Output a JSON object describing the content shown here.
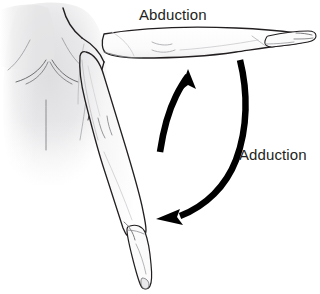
{
  "figure": {
    "title_visible": false,
    "background_color": "#ffffff",
    "view": "posterior"
  },
  "labels": {
    "abduction": "Abduction",
    "adduction": "Adduction"
  },
  "colors": {
    "outline": "#231f20",
    "arrow": "#000000",
    "text": "#231f20",
    "skin_fill": "#ffffff",
    "torso_shade": "#e2e2e4",
    "torso_shade_light": "#f0f0f2",
    "detail_line": "#6d6e71",
    "background": "#ffffff"
  },
  "arrows": [
    {
      "name": "abduction-arrow",
      "label": "Abduction",
      "direction": "upward",
      "meaning": "movement of arm away from midline of body",
      "tip_x": 188,
      "tip_y": 70,
      "tail_x": 160,
      "tail_y": 152
    },
    {
      "name": "adduction-arrow",
      "label": "Adduction",
      "direction": "downward",
      "meaning": "movement of arm toward midline of body",
      "tip_x": 157,
      "tip_y": 218,
      "tail_x": 240,
      "tail_y": 60
    }
  ],
  "limbs": [
    {
      "name": "abducted-arm",
      "position": "horizontal-raised",
      "description": "right arm extended laterally at shoulder height with open hand"
    },
    {
      "name": "adducted-arm",
      "position": "hanging-down",
      "description": "right arm hanging alongside the body with relaxed hand"
    }
  ]
}
